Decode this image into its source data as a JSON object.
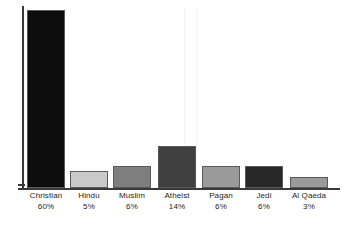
{
  "chart_data": {
    "type": "bar",
    "title": "",
    "subtitle": "",
    "xlabel": "",
    "ylabel": "",
    "categories": [
      "Christian",
      "Hindu",
      "Muslim",
      "Atheist",
      "Pagan",
      "Jedi",
      "Al Qaeda"
    ],
    "values": [
      60,
      5,
      6,
      14,
      6,
      6,
      3
    ],
    "value_labels": [
      "60%",
      "5%",
      "6%",
      "14%",
      "6%",
      "6%",
      "3%"
    ],
    "unit": "%",
    "ylim": [
      0,
      62
    ],
    "grid": false,
    "legend": false,
    "legend_position": "none",
    "bar_colors": [
      "#0d0d0d",
      "#c9c9c9",
      "#7e7e7e",
      "#3f3f3f",
      "#9a9a9a",
      "#272727",
      "#9a9a9a"
    ],
    "bar_border_color": "#5a5a5a",
    "axis_color": "#3a3a3a",
    "background_color": "#ffffff",
    "text_color": "#1e1e1e",
    "bars": [
      {
        "category": "Christian",
        "value": 60,
        "value_label": "60%",
        "color": "#0d0d0d",
        "left": 27,
        "width": 38,
        "height": 178,
        "label_left": 22,
        "label_width": 48
      },
      {
        "category": "Hindu",
        "value": 5,
        "value_label": "5%",
        "color": "#c9c9c9",
        "left": 70,
        "width": 38,
        "height": 17,
        "label_left": 65,
        "label_width": 48
      },
      {
        "category": "Muslim",
        "value": 6,
        "value_label": "6%",
        "color": "#7e7e7e",
        "left": 113,
        "width": 38,
        "height": 22,
        "label_left": 108,
        "label_width": 48
      },
      {
        "category": "Atheist",
        "value": 14,
        "value_label": "14%",
        "color": "#3f3f3f",
        "left": 158,
        "width": 38,
        "height": 42,
        "label_left": 153,
        "label_width": 48
      },
      {
        "category": "Pagan",
        "value": 6,
        "value_label": "6%",
        "color": "#9a9a9a",
        "left": 202,
        "width": 38,
        "height": 22,
        "label_left": 197,
        "label_width": 48
      },
      {
        "category": "Jedi",
        "value": 6,
        "value_label": "6%",
        "color": "#272727",
        "left": 245,
        "width": 38,
        "height": 22,
        "label_left": 240,
        "label_width": 48
      },
      {
        "category": "Al Qaeda",
        "value": 3,
        "value_label": "3%",
        "color": "#9a9a9a",
        "left": 290,
        "width": 38,
        "height": 11,
        "label_left": 285,
        "label_width": 48
      }
    ],
    "faint_rules": [
      184,
      196
    ]
  }
}
